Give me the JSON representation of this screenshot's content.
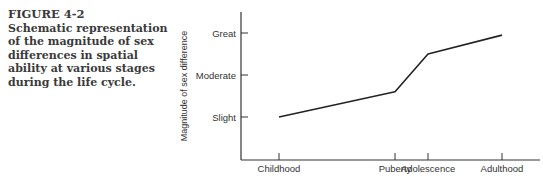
{
  "caption": {
    "figure_label": "FIGURE 4-2",
    "text": "Schematic representation of the magnitude of sex differences in spatial ability at various stages during the life cycle."
  },
  "chart_data": {
    "type": "line",
    "title": "",
    "xlabel": "",
    "ylabel": "Magnitude of sex difference",
    "categories": [
      "Childhood",
      "Puberty",
      "Adolescence",
      "Adulthood"
    ],
    "x": [
      0,
      3.1,
      4.0,
      6.0
    ],
    "y_tick_labels": [
      "Slight",
      "Moderate",
      "Great"
    ],
    "y_tick_values": [
      1,
      2,
      3
    ],
    "ylim": [
      0,
      3.5
    ],
    "xlim": [
      -1,
      7
    ],
    "series": [
      {
        "name": "Sex difference in spatial ability",
        "values": [
          1.0,
          1.6,
          2.5,
          2.95
        ]
      }
    ],
    "grid": false,
    "legend": "none"
  }
}
